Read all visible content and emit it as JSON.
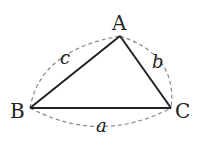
{
  "diagram": {
    "type": "triangle",
    "vertices": [
      {
        "name": "A",
        "x": 120,
        "y": 36
      },
      {
        "name": "B",
        "x": 30,
        "y": 108
      },
      {
        "name": "C",
        "x": 171,
        "y": 108
      }
    ],
    "sides": [
      {
        "name": "a",
        "from": "B",
        "to": "C"
      },
      {
        "name": "b",
        "from": "A",
        "to": "C"
      },
      {
        "name": "c",
        "from": "A",
        "to": "B"
      }
    ],
    "labels": {
      "vertex_a": "A",
      "vertex_b": "B",
      "vertex_c": "C",
      "side_a": "a",
      "side_b": "b",
      "side_c": "c"
    },
    "colors": {
      "edge": "#222222",
      "dashed_arc": "#888888"
    }
  }
}
